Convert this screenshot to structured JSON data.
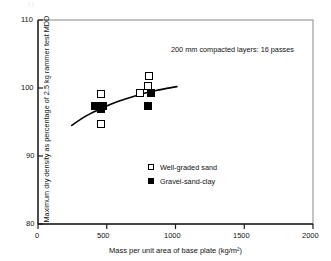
{
  "chart_data": {
    "type": "scatter",
    "title": "",
    "xlabel": "Mass per unit area of base plate (kg/m²)",
    "ylabel": "Maximum dry density as percentage of 2.5 kg rammer test MDD",
    "xlim": [
      0,
      2000
    ],
    "ylim": [
      80,
      110
    ],
    "xticks": [
      0,
      500,
      1000,
      1500,
      2000
    ],
    "xtick_labels": [
      "0",
      "500",
      "1000",
      "1500",
      "2000"
    ],
    "yticks": [
      80,
      90,
      100,
      110
    ],
    "ytick_labels": [
      "80",
      "90",
      "100",
      "110"
    ],
    "grid": false,
    "legend_position": "inside-lower-center",
    "annotations": [
      {
        "text": "200 mm compacted layers: 16 passes",
        "x": 970,
        "y": 106.3
      }
    ],
    "series": [
      {
        "name": "Well-graded sand",
        "marker": "open-square",
        "color": "#ffffff",
        "edge_color": "#000000",
        "points": [
          {
            "x": 455,
            "y": 99.1
          },
          {
            "x": 460,
            "y": 94.7
          },
          {
            "x": 740,
            "y": 99.3
          },
          {
            "x": 800,
            "y": 100.3
          },
          {
            "x": 810,
            "y": 101.7
          }
        ]
      },
      {
        "name": "Gravel-sand-clay",
        "marker": "filled-square",
        "color": "#000000",
        "edge_color": "#000000",
        "points": [
          {
            "x": 415,
            "y": 97.4
          },
          {
            "x": 455,
            "y": 96.9
          },
          {
            "x": 470,
            "y": 97.3
          },
          {
            "x": 800,
            "y": 97.4
          },
          {
            "x": 825,
            "y": 99.2
          }
        ]
      }
    ],
    "trend_curve": {
      "name": "fitted trend line",
      "color": "#000000",
      "points": [
        {
          "x": 245,
          "y": 94.5
        },
        {
          "x": 350,
          "y": 95.9
        },
        {
          "x": 460,
          "y": 97.0
        },
        {
          "x": 580,
          "y": 98.0
        },
        {
          "x": 700,
          "y": 98.8
        },
        {
          "x": 850,
          "y": 99.6
        },
        {
          "x": 1010,
          "y": 100.2
        }
      ]
    }
  },
  "axis": {
    "x_label": "Mass per unit area of base plate (kg/m²)",
    "y_label": "Maximum dry density as percentage of 2.5 kg rammer test MDD",
    "x_ticks": [
      "0",
      "500",
      "1000",
      "1500",
      "2000"
    ],
    "y_ticks": [
      "110",
      "100",
      "90",
      "80"
    ]
  },
  "annotation": {
    "text": "200 mm compacted layers: 16 passes"
  },
  "legend": {
    "items": [
      {
        "label": "Well-graded sand",
        "marker": "open-square"
      },
      {
        "label": "Gravel-sand-clay",
        "marker": "filled-square"
      }
    ]
  },
  "colors": {
    "ink": "#000000",
    "frame": "#555555",
    "background": "#ffffff"
  }
}
